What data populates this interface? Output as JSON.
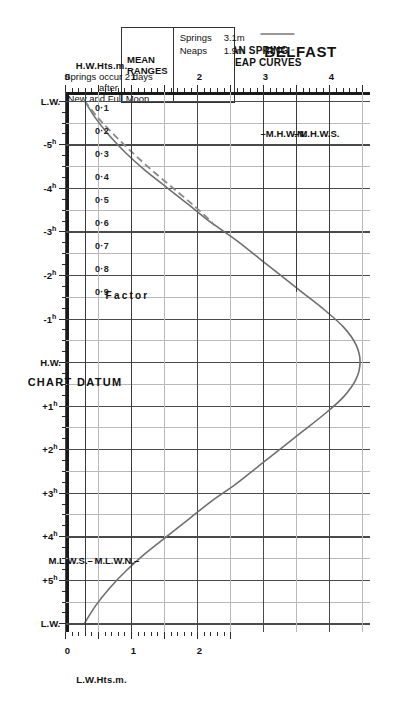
{
  "title": "BELFAST",
  "subtitle_line1": "MEAN SPRING",
  "subtitle_line2": "AND NEAP CURVES",
  "legend": {
    "header": "MEAN RANGES",
    "springs_key": "Springs",
    "springs_value": "3.1m",
    "neaps_key": "Neaps",
    "neaps_value": "1.9m",
    "springs_style": "solid",
    "neaps_style": "dashed"
  },
  "note_line1": "Springs occur 2 days",
  "note_line2": "after",
  "note_line3": "New and Full Moon",
  "chart_datum_label": "CHART DATUM",
  "axes": {
    "hw_axis_title": "H.W.Hts.m.",
    "lw_axis_title": "L.W.Hts.m.",
    "factor_title": "Factor",
    "hw_height_ticks": [
      "0",
      "1",
      "2",
      "3",
      "4"
    ],
    "lw_height_ticks": [
      "0",
      "1",
      "2"
    ],
    "factor_ticks": [
      "0·9",
      "0·8",
      "0·7",
      "0·6",
      "0·5",
      "0·4",
      "0·3",
      "0·2",
      "0·1"
    ],
    "time_ticks": [
      "L.W.",
      "-5",
      "-4",
      "-3",
      "-2",
      "-1",
      "H.W.",
      "+1",
      "+2",
      "+3",
      "+4",
      "+5",
      "L.W."
    ]
  },
  "markers": {
    "mhws": "M.H.W.S.",
    "mhwn": "M.H.W.N.",
    "mlwn": "M.L.W.N.",
    "mlws": "M.L.W.S."
  },
  "colors": {
    "curve": "#6f6f6f",
    "neap_curve": "#8a8a8a",
    "grid": "#8d8d8d",
    "grid_major": "#4a4a4a",
    "axis": "#1a1a1a"
  },
  "chart_data": {
    "type": "line",
    "xlabel": "Time relative to High Water (hours)",
    "ylabel": "H.W. Heights (m) / Factor",
    "xlim": [
      -6.4,
      6.4
    ],
    "ylim": [
      0,
      4.6
    ],
    "grid": true,
    "legend_position": "top-left",
    "mean_range_springs_m": 3.1,
    "mean_range_neaps_m": 1.9,
    "mhws_m": 3.5,
    "mhwn_m": 3.0,
    "mlwn_m": 1.0,
    "mlws_m": 0.3,
    "factor_axis": [
      0.1,
      0.2,
      0.3,
      0.4,
      0.5,
      0.6,
      0.7,
      0.8,
      0.9
    ],
    "hw_height_axis": [
      0,
      1,
      2,
      3,
      4
    ],
    "lw_height_axis": [
      0,
      1,
      2
    ],
    "time_axis_hours": [
      -6,
      -5,
      -4,
      -3,
      -2,
      -1,
      0,
      1,
      2,
      3,
      4,
      5,
      6
    ],
    "series": [
      {
        "name": "Springs",
        "style": "solid",
        "x": [
          -6.0,
          -5.6,
          -5.2,
          -4.8,
          -4.4,
          -4.0,
          -3.6,
          -3.2,
          -2.8,
          -2.4,
          -2.0,
          -1.6,
          -1.2,
          -0.8,
          -0.4,
          0.0,
          0.4,
          0.8,
          1.2,
          1.6,
          2.0,
          2.4,
          2.8,
          3.2,
          3.6,
          4.0,
          4.4,
          4.8,
          5.2,
          5.6,
          6.0
        ],
        "factor": [
          0.0,
          0.04,
          0.09,
          0.15,
          0.22,
          0.3,
          0.38,
          0.46,
          0.55,
          0.63,
          0.71,
          0.79,
          0.87,
          0.94,
          0.985,
          1.0,
          0.985,
          0.94,
          0.87,
          0.79,
          0.71,
          0.63,
          0.55,
          0.46,
          0.38,
          0.3,
          0.22,
          0.15,
          0.09,
          0.04,
          0.0
        ]
      },
      {
        "name": "Neaps",
        "style": "dashed",
        "x": [
          -6.0,
          -5.6,
          -5.2,
          -4.8,
          -4.4,
          -4.0,
          -3.6,
          -3.2
        ],
        "factor": [
          0.0,
          0.05,
          0.11,
          0.175,
          0.245,
          0.32,
          0.395,
          0.465
        ]
      }
    ]
  }
}
